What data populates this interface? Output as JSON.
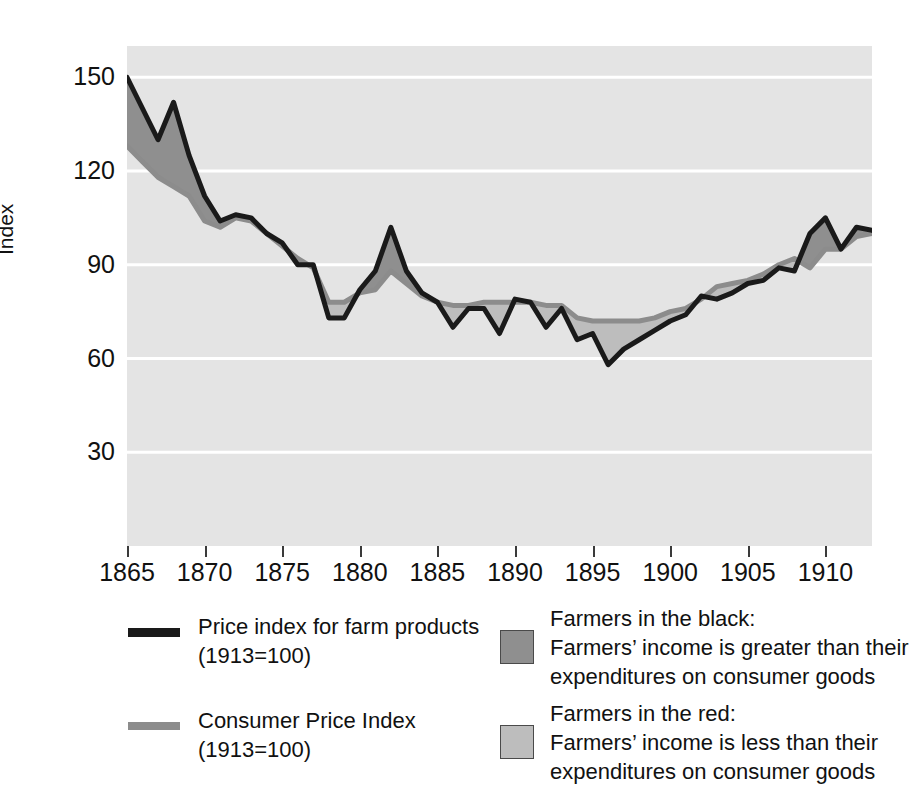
{
  "axes": {
    "ylabel": "Index",
    "yticks": [
      30,
      60,
      90,
      120,
      150
    ],
    "ylim": [
      0,
      160
    ],
    "xticks": [
      1865,
      1870,
      1875,
      1880,
      1885,
      1890,
      1895,
      1900,
      1905,
      1910
    ],
    "xlim": [
      1865,
      1913
    ]
  },
  "legend": {
    "series": [
      {
        "key": "farm-line",
        "color": "#1a1a1a",
        "label": "Price index for farm products",
        "sub": "(1913=100)"
      },
      {
        "key": "cpi-line",
        "color": "#8c8c8c",
        "label": "Consumer Price Index",
        "sub": "(1913=100)"
      }
    ],
    "bands": [
      {
        "key": "farmers-in-the-black",
        "color": "#8f8f8f",
        "title": "Farmers in the black:",
        "line1": "Farmers’ income is greater than their",
        "line2": "expenditures on consumer goods"
      },
      {
        "key": "farmers-in-the-red",
        "color": "#bdbdbd",
        "title": "Farmers in the red:",
        "line1": "Farmers’ income is less than their",
        "line2": "expenditures on consumer goods"
      }
    ]
  },
  "chart_data": {
    "type": "line",
    "title": "",
    "subtitle": "",
    "xlabel": "",
    "ylabel": "Index",
    "xlim": [
      1865,
      1913
    ],
    "ylim": [
      0,
      160
    ],
    "grid": "horizontal",
    "grid_color": "#ffffff",
    "plot_background": "#e4e4e4",
    "legend_position": "below",
    "x": [
      1865,
      1866,
      1867,
      1868,
      1869,
      1870,
      1871,
      1872,
      1873,
      1874,
      1875,
      1876,
      1877,
      1878,
      1879,
      1880,
      1881,
      1882,
      1883,
      1884,
      1885,
      1886,
      1887,
      1888,
      1889,
      1890,
      1891,
      1892,
      1893,
      1894,
      1895,
      1896,
      1897,
      1898,
      1899,
      1900,
      1901,
      1902,
      1903,
      1904,
      1905,
      1906,
      1907,
      1908,
      1909,
      1910,
      1911,
      1912,
      1913
    ],
    "series": [
      {
        "name": "Price index for farm products",
        "color": "#1a1a1a",
        "linewidth": 5,
        "values": [
          150,
          140,
          130,
          142,
          125,
          112,
          104,
          106,
          105,
          100,
          97,
          90,
          90,
          73,
          73,
          82,
          88,
          102,
          88,
          81,
          78,
          70,
          76,
          76,
          68,
          79,
          78,
          70,
          76,
          66,
          68,
          58,
          63,
          66,
          69,
          72,
          74,
          80,
          79,
          81,
          84,
          85,
          89,
          88,
          100,
          105,
          95,
          102,
          101
        ]
      },
      {
        "name": "Consumer Price Index",
        "color": "#8c8c8c",
        "linewidth": 5,
        "values": [
          128,
          123,
          118,
          115,
          112,
          104,
          102,
          105,
          104,
          100,
          96,
          92,
          89,
          78,
          78,
          81,
          82,
          88,
          84,
          80,
          78,
          77,
          77,
          78,
          78,
          78,
          78,
          77,
          77,
          73,
          72,
          72,
          72,
          72,
          73,
          75,
          76,
          79,
          83,
          84,
          85,
          87,
          90,
          92,
          89,
          95,
          95,
          99,
          100
        ]
      }
    ],
    "bands": [
      {
        "name": "Farmers in the black",
        "color": "#8f8f8f",
        "condition": "farm_price > cpi"
      },
      {
        "name": "Farmers in the red",
        "color": "#bdbdbd",
        "condition": "farm_price < cpi"
      }
    ]
  }
}
